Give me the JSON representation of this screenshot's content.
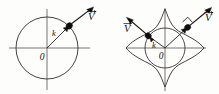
{
  "figure": {
    "background_color": "#fdfdfc",
    "line_color": "#3a3734",
    "axis_color": "#55524f",
    "marker_color": "#100e0c",
    "width": 219,
    "height": 94
  },
  "panels": [
    {
      "id": "left-panel",
      "name": "isotropic-circular-fermi-surface",
      "description": "Circular (isotropic) Fermi surface with velocity parallel to k",
      "center": {
        "x": 47,
        "y": 48
      },
      "surface": {
        "type": "circle",
        "radius": 31
      },
      "origin_label": "0",
      "origin_label_position": {
        "x": 42,
        "y": 58
      },
      "axes": {
        "horizontal": {
          "x1": 9,
          "y1": 48,
          "x2": 90,
          "y2": 48
        },
        "vertical": {
          "x1": 47,
          "y1": 9,
          "x2": 47,
          "y2": 90
        }
      },
      "states": [
        {
          "name": "state-point-1",
          "dot": {
            "x": 69,
            "y": 26
          },
          "k_vector": {
            "from": {
              "x": 47,
              "y": 48
            },
            "to": {
              "x": 68,
              "y": 27
            }
          },
          "k_label": "k",
          "k_label_position": {
            "x": 55,
            "y": 34
          },
          "v_vector": {
            "from": {
              "x": 71,
              "y": 24
            },
            "to": {
              "x": 93,
              "y": 7
            }
          },
          "v_label": "V",
          "v_label_position": {
            "x": 91,
            "y": 17
          }
        }
      ]
    },
    {
      "id": "right-panel",
      "name": "anisotropic-star-fermi-surface",
      "description": "Anisotropic star-shaped Fermi surface; velocity normal to surface, not parallel to k",
      "center": {
        "x": 165,
        "y": 48
      },
      "surface": {
        "type": "four-pointed-star",
        "outer_radius": 39,
        "waist_radius": 20
      },
      "inner_circle_radius": 20,
      "origin_label": "0",
      "origin_label_position": {
        "x": 161,
        "y": 57
      },
      "axes": {
        "horizontal": {
          "x1": 126,
          "y1": 48,
          "x2": 206,
          "y2": 48
        },
        "vertical": {
          "x1": 165,
          "y1": 8,
          "x2": 165,
          "y2": 91
        }
      },
      "states": [
        {
          "name": "state-point-1",
          "dot": {
            "x": 188,
            "y": 27
          },
          "k_vector": {
            "from": {
              "x": 165,
              "y": 48
            },
            "to": {
              "x": 186,
              "y": 29
            }
          },
          "k_label": "",
          "k_label_position": {
            "x": 0,
            "y": 0
          },
          "v_vector": {
            "from": {
              "x": 190,
              "y": 25
            },
            "to": {
              "x": 211,
              "y": 7
            }
          },
          "v_label": "V",
          "v_label_position": {
            "x": 208,
            "y": 18
          },
          "perpendicular_mark": true
        },
        {
          "name": "state-point-2",
          "dot": {
            "x": 148,
            "y": 36
          },
          "k_vector": {
            "from": {
              "x": 165,
              "y": 48
            },
            "to": {
              "x": 150,
              "y": 37
            }
          },
          "k_label": "k",
          "k_label_position": {
            "x": 154,
            "y": 45
          },
          "v_vector": {
            "from": {
              "x": 146,
              "y": 34
            },
            "to": {
              "x": 126,
              "y": 17
            }
          },
          "v_label": "V",
          "v_label_position": {
            "x": 127,
            "y": 28
          },
          "perpendicular_mark": false
        }
      ]
    }
  ],
  "symbols": {
    "wavevector": "k",
    "velocity": "V",
    "origin": "0"
  }
}
